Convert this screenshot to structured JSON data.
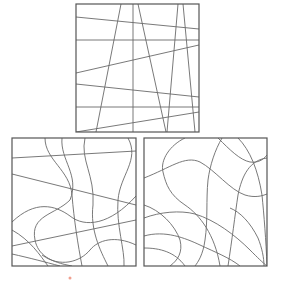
{
  "canvas": {
    "width": 283,
    "height": 281,
    "background": "#ffffff"
  },
  "colors": {
    "frame": "#555555",
    "line": "#6a6a6a",
    "mark": "#f0a090"
  },
  "panels": [
    {
      "id": "top",
      "kind": "straight-lines",
      "rect": {
        "x": 76,
        "y": 4,
        "w": 123,
        "h": 128
      },
      "paths": [
        "M76,17 L199,29",
        "M76,40 L199,40",
        "M76,73 L199,45",
        "M76,84 L199,97",
        "M76,107 L199,107",
        "M76,132 L199,112",
        "M121,4 L96,132",
        "M133,4 L133,132",
        "M138,4 L166,132",
        "M178,4 L167,132",
        "M183,4 L195,132"
      ]
    },
    {
      "id": "bottom-left",
      "kind": "curved-lines",
      "rect": {
        "x": 12,
        "y": 138,
        "w": 124,
        "h": 128
      },
      "paths": [
        "M12,158 L136,151",
        "M12,174 L136,205",
        "M12,246 L136,220",
        "M45,138 C45,160 70,170 72,195 C74,220 78,245 82,266",
        "M85,138 C80,160 95,175 93,205 C90,230 100,250 108,266",
        "M128,138 C140,160 120,175 118,200 C116,225 125,250 124,266",
        "M12,222 C35,200 55,205 70,216 C85,228 110,225 136,196",
        "M62,138 C60,160 80,175 70,200 C55,215 30,215 35,240 C38,255 50,262 72,266",
        "M12,254 C30,258 45,262 60,266",
        "M42,255 C60,268 80,262 90,250 C98,240 115,235 136,245",
        "M12,230 C30,240 40,255 48,266"
      ]
    },
    {
      "id": "bottom-right",
      "kind": "curved-lines",
      "rect": {
        "x": 144,
        "y": 138,
        "w": 123,
        "h": 128
      },
      "paths": [
        "M185,138 C170,145 160,160 163,172 C166,185 170,195 185,205 C200,215 215,235 220,266",
        "M144,178 C170,168 185,155 200,162 C215,170 230,190 245,195 C255,198 262,196 267,194",
        "M222,138 C215,150 210,165 208,180 C206,200 208,220 205,240 C203,255 198,262 195,266",
        "M218,138 C230,150 240,160 250,162 C258,163 263,160 267,155",
        "M267,158 C250,160 242,175 238,195 C235,215 232,240 228,266",
        "M144,218 C160,212 180,210 195,214 C215,220 235,235 250,250 C258,258 262,262 267,266",
        "M144,236 C165,230 185,238 200,245 C215,252 230,258 240,266",
        "M144,248 C160,248 175,252 185,266",
        "M144,205 C160,210 175,225 180,240 C183,252 178,260 170,266",
        "M238,138 C250,150 258,170 262,195 C264,215 266,240 267,266",
        "M230,208 C240,212 250,222 258,238 C262,248 264,258 264,266"
      ]
    }
  ],
  "mark": {
    "x": 70,
    "y": 278,
    "r": 1.5
  }
}
